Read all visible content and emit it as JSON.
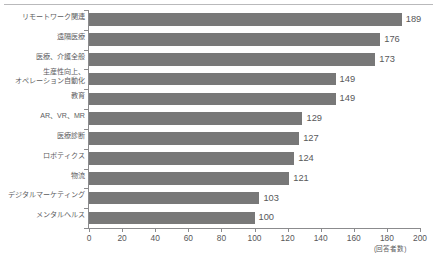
{
  "chart_data": {
    "type": "bar",
    "orientation": "horizontal",
    "title": "",
    "subtitle": "",
    "xlabel": "(回答者数)",
    "ylabel": "",
    "xlim": [
      0,
      200
    ],
    "xticks": [
      0,
      20,
      40,
      60,
      80,
      100,
      120,
      140,
      160,
      180,
      200
    ],
    "xtick_labels": [
      "0",
      "20",
      "40",
      "60",
      "80",
      "100",
      "120",
      "140",
      "160",
      "180",
      "200"
    ],
    "grid": false,
    "legend": null,
    "bar_color": "#787878",
    "axis_color": "#8b8b8d",
    "text_color": "#58585a",
    "categories": [
      "リモートワーク関連",
      "遠隔医療",
      "医療、介護全般",
      "生産性向上、\nオペレーション自動化",
      "教育",
      "AR、VR、MR",
      "医療診断",
      "ロボティクス",
      "物流",
      "デジタルマーケティング",
      "メンタルヘルス"
    ],
    "values": [
      189,
      176,
      173,
      149,
      149,
      129,
      127,
      124,
      121,
      103,
      100
    ],
    "value_labels": [
      "189",
      "176",
      "173",
      "149",
      "149",
      "129",
      "127",
      "124",
      "121",
      "103",
      "100"
    ]
  }
}
